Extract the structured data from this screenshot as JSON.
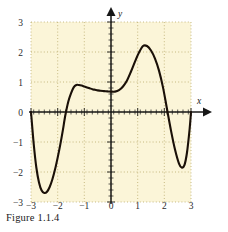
{
  "figure": {
    "caption": "Figure 1.1.4",
    "x_axis_name": "x",
    "y_axis_name": "y"
  },
  "colors": {
    "plot_background": "#fbf5d8",
    "curve": "#1a1008",
    "axis": "#171717",
    "gridline": "#b9a96b",
    "tick_label": "#2b2b2b"
  },
  "chart_data": {
    "type": "line",
    "title": "Figure 1.1.4",
    "xlabel": "x",
    "ylabel": "y",
    "xlim": [
      -3,
      3
    ],
    "ylim": [
      -3,
      3
    ],
    "grid": true,
    "grid_style": "dotted",
    "legend": null,
    "xticks": [
      -3,
      -2,
      -1,
      0,
      1,
      2,
      3
    ],
    "xtick_labels": [
      "−3",
      "−2",
      "−1",
      "0",
      "1",
      "2",
      "3"
    ],
    "yticks": [
      -3,
      -2,
      -1,
      0,
      1,
      2,
      3
    ],
    "ytick_labels": [
      "−3",
      "−2",
      "−1",
      "0",
      "1",
      "2",
      "3"
    ],
    "minor_tick_interval": 0.2,
    "series": [
      {
        "name": "curve",
        "x": [
          -3.0,
          -2.9,
          -2.8,
          -2.7,
          -2.6,
          -2.5,
          -2.4,
          -2.3,
          -2.2,
          -2.1,
          -2.0,
          -1.9,
          -1.8,
          -1.75,
          -1.7,
          -1.6,
          -1.5,
          -1.4,
          -1.3,
          -1.2,
          -1.1,
          -1.0,
          -0.9,
          -0.8,
          -0.7,
          -0.6,
          -0.5,
          -0.4,
          -0.3,
          -0.2,
          -0.1,
          0.0,
          0.15,
          0.3,
          0.45,
          0.6,
          0.75,
          0.9,
          1.05,
          1.2,
          1.35,
          1.5,
          1.65,
          1.8,
          1.95,
          2.1,
          2.25,
          2.4,
          2.55,
          2.65,
          2.75,
          2.85,
          2.95,
          3.0
        ],
        "y": [
          0.0,
          -1.05,
          -1.85,
          -2.35,
          -2.62,
          -2.7,
          -2.66,
          -2.5,
          -2.25,
          -1.92,
          -1.52,
          -1.08,
          -0.58,
          -0.3,
          -0.05,
          0.35,
          0.62,
          0.82,
          0.9,
          0.9,
          0.88,
          0.85,
          0.82,
          0.79,
          0.76,
          0.74,
          0.72,
          0.71,
          0.7,
          0.69,
          0.685,
          0.68,
          0.68,
          0.73,
          0.85,
          1.05,
          1.35,
          1.68,
          1.98,
          2.2,
          2.2,
          2.05,
          1.78,
          1.38,
          0.82,
          0.1,
          -0.62,
          -1.25,
          -1.72,
          -1.85,
          -1.78,
          -1.35,
          -0.55,
          0.0
        ]
      }
    ],
    "key_points": [
      {
        "label": "left endpoint",
        "x": -3.0,
        "y": 0.0
      },
      {
        "label": "local minimum",
        "x": -2.5,
        "y": -2.7
      },
      {
        "label": "x-intercept",
        "x": -1.75,
        "y": 0.0
      },
      {
        "label": "local maximum",
        "x": -1.3,
        "y": 0.9
      },
      {
        "label": "local minimum",
        "x": 0.15,
        "y": 0.68
      },
      {
        "label": "local maximum",
        "x": 1.2,
        "y": 2.2
      },
      {
        "label": "x-intercept",
        "x": 2.1,
        "y": 0.0
      },
      {
        "label": "local minimum",
        "x": 2.65,
        "y": -1.85
      },
      {
        "label": "right endpoint",
        "x": 3.0,
        "y": 0.0
      }
    ]
  }
}
